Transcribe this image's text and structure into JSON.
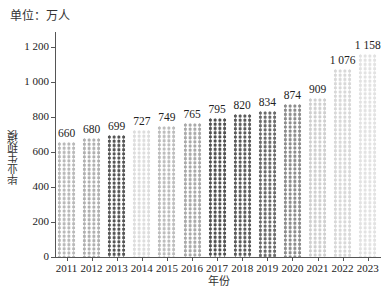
{
  "unit_label": "单位：万人",
  "chart_data": {
    "type": "bar",
    "title": "",
    "xlabel": "年份",
    "ylabel": "毕业生规模",
    "unit": "单位：万人",
    "categories": [
      "2011",
      "2012",
      "2013",
      "2014",
      "2015",
      "2016",
      "2017",
      "2018",
      "2019",
      "2020",
      "2021",
      "2022",
      "2023"
    ],
    "values": [
      660,
      680,
      699,
      727,
      749,
      765,
      795,
      820,
      834,
      874,
      909,
      1076,
      1158
    ],
    "value_labels": [
      "660",
      "680",
      "699",
      "727",
      "749",
      "765",
      "795",
      "820",
      "834",
      "874",
      "909",
      "1 076",
      "1 158"
    ],
    "ylim": [
      0,
      1200
    ],
    "yticks": [
      0,
      200,
      400,
      600,
      800,
      1000,
      1200
    ],
    "ytick_labels": [
      "0",
      "200",
      "400",
      "600",
      "800",
      "1 000",
      "1 200"
    ],
    "grid": false,
    "legend": null,
    "bar_fill": "pictogram pattern (varied shades of gray)",
    "bar_colors": [
      "#b9b9b9",
      "#b0b0b0",
      "#555555",
      "#dddddd",
      "#bdbdbd",
      "#a9a9a9",
      "#505050",
      "#5a5a5a",
      "#6a6a6a",
      "#8c8c8c",
      "#cfcfcf",
      "#d8d8d8",
      "#e2e2e2"
    ]
  }
}
